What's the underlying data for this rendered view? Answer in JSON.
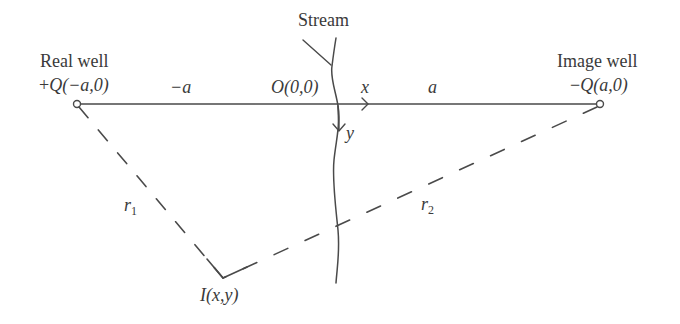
{
  "diagram": {
    "type": "method-of-images schematic",
    "colors": {
      "line": "#4a4a4a",
      "text": "#3a3a3a",
      "background": "#ffffff"
    },
    "labels": {
      "stream": "Stream",
      "real_well_name": "Real well",
      "real_well_coord_sign": "+",
      "real_well_coord_Q": "Q",
      "real_well_coord_args": "(−a,0)",
      "image_well_name": "Image well",
      "image_well_coord_sign": "−",
      "image_well_coord_Q": "Q",
      "image_well_coord_args": "(a,0)",
      "origin": "O(0,0)",
      "neg_a": "−a",
      "pos_a": "a",
      "x_axis": "x",
      "y_axis": "y",
      "r1_base": "r",
      "r1_sub": "1",
      "r2_base": "r",
      "r2_sub": "2",
      "point": "I(x,y)"
    },
    "nodes": [
      {
        "id": "real-well",
        "label": "Real well",
        "discharge": "+Q",
        "coords": "(−a,0)",
        "px": [
          77,
          104
        ]
      },
      {
        "id": "image-well",
        "label": "Image well",
        "discharge": "−Q",
        "coords": "(a,0)",
        "px": [
          600,
          104
        ]
      },
      {
        "id": "origin",
        "label": "O(0,0)",
        "px": [
          338,
          104
        ]
      },
      {
        "id": "point-I",
        "label": "I(x,y)",
        "px": [
          223,
          278
        ]
      }
    ],
    "edges": [
      {
        "from": "real-well",
        "to": "image-well",
        "style": "solid",
        "label": "−a / a"
      },
      {
        "from": "real-well",
        "to": "point-I",
        "style": "dashed",
        "label": "r1"
      },
      {
        "from": "image-well",
        "to": "point-I",
        "style": "dashed",
        "label": "r2"
      }
    ]
  }
}
